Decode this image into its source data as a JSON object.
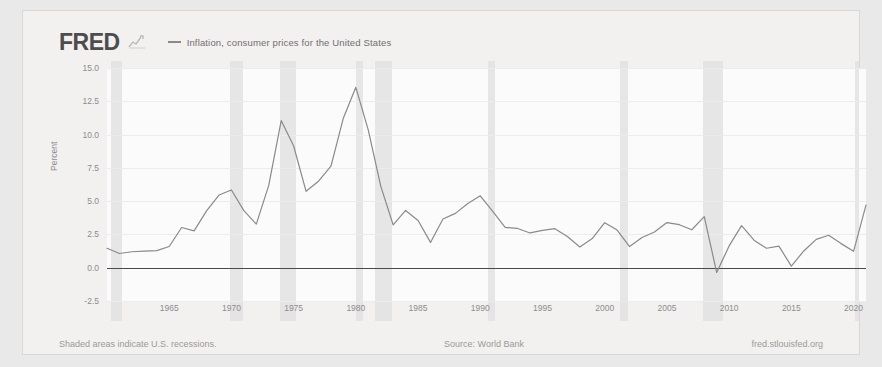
{
  "brand": {
    "logo_text": "FRED",
    "logo_mark": "chart-squiggle-icon"
  },
  "legend": {
    "items": [
      {
        "label": "Inflation, consumer prices for the United States",
        "color": "#8a8a8a"
      }
    ]
  },
  "footer": {
    "left": "Shaded areas indicate U.S. recessions.",
    "center": "Source: World Bank",
    "right": "fred.stlouisfed.org"
  },
  "chart_data": {
    "type": "line",
    "title": "",
    "xlabel": "",
    "ylabel": "Percent",
    "xlim": [
      1960,
      2021
    ],
    "ylim": [
      -2.5,
      15.0
    ],
    "yticks": [
      "15.0",
      "12.5",
      "10.0",
      "7.5",
      "5.0",
      "2.5",
      "0.0",
      "-2.5"
    ],
    "ytick_values": [
      15.0,
      12.5,
      10.0,
      7.5,
      5.0,
      2.5,
      0.0,
      -2.5
    ],
    "xticks": [
      "1965",
      "1970",
      "1975",
      "1980",
      "1985",
      "1990",
      "1995",
      "2000",
      "2005",
      "2010",
      "2015",
      "2020"
    ],
    "xtick_values": [
      1965,
      1970,
      1975,
      1980,
      1985,
      1990,
      1995,
      2000,
      2005,
      2010,
      2015,
      2020
    ],
    "grid": true,
    "legend_position": "top",
    "line_color": "#8a8a8a",
    "zero_line_color": "#4a4a4a",
    "recession_color": "#e2e2e2",
    "recession_note": "Shaded areas indicate U.S. recessions.",
    "recessions": [
      [
        1960.3,
        1961.2
      ],
      [
        1969.9,
        1970.9
      ],
      [
        1973.9,
        1975.2
      ],
      [
        1980.0,
        1980.6
      ],
      [
        1981.5,
        1982.9
      ],
      [
        1990.6,
        1991.2
      ],
      [
        2001.2,
        2001.9
      ],
      [
        2007.9,
        2009.5
      ],
      [
        2020.1,
        2020.4
      ]
    ],
    "series": [
      {
        "name": "Inflation, consumer prices for the United States",
        "x": [
          1960,
          1961,
          1962,
          1963,
          1964,
          1965,
          1966,
          1967,
          1968,
          1969,
          1970,
          1971,
          1972,
          1973,
          1974,
          1975,
          1976,
          1977,
          1978,
          1979,
          1980,
          1981,
          1982,
          1983,
          1984,
          1985,
          1986,
          1987,
          1988,
          1989,
          1990,
          1991,
          1992,
          1993,
          1994,
          1995,
          1996,
          1997,
          1998,
          1999,
          2000,
          2001,
          2002,
          2003,
          2004,
          2005,
          2006,
          2007,
          2008,
          2009,
          2010,
          2011,
          2012,
          2013,
          2014,
          2015,
          2016,
          2017,
          2018,
          2019,
          2020,
          2021
        ],
        "values": [
          1.46,
          1.07,
          1.2,
          1.24,
          1.28,
          1.59,
          3.02,
          2.77,
          4.27,
          5.46,
          5.84,
          4.29,
          3.27,
          6.18,
          11.05,
          9.14,
          5.74,
          6.5,
          7.63,
          11.25,
          13.55,
          10.33,
          6.13,
          3.21,
          4.3,
          3.55,
          1.9,
          3.66,
          4.08,
          4.83,
          5.4,
          4.23,
          3.03,
          2.95,
          2.61,
          2.81,
          2.93,
          2.34,
          1.55,
          2.19,
          3.38,
          2.83,
          1.59,
          2.27,
          2.68,
          3.39,
          3.23,
          2.85,
          3.84,
          -0.36,
          1.64,
          3.16,
          2.07,
          1.46,
          1.62,
          0.12,
          1.26,
          2.13,
          2.44,
          1.81,
          1.23,
          4.7
        ]
      }
    ]
  }
}
